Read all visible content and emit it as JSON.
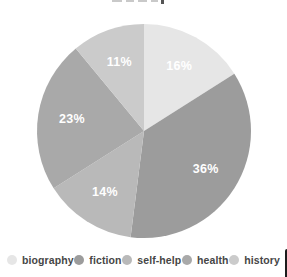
{
  "chart_data": {
    "type": "pie",
    "categories": [
      "biography",
      "fiction",
      "self-help",
      "health",
      "history"
    ],
    "values": [
      16,
      36,
      14,
      23,
      11
    ],
    "labels": [
      "16%",
      "36%",
      "14%",
      "23%",
      "11%"
    ],
    "colors": [
      "#e6e6e6",
      "#9c9c9c",
      "#b9b9b9",
      "#a9a9a9",
      "#cbcbcb"
    ],
    "label_color": "#ffffff",
    "start_angle_deg": 0,
    "direction": "clockwise",
    "legend_position": "bottom"
  },
  "legend": {
    "items": [
      {
        "label": "biography",
        "color": "#e6e6e6"
      },
      {
        "label": "fiction",
        "color": "#9c9c9c"
      },
      {
        "label": "self-help",
        "color": "#b9b9b9"
      },
      {
        "label": "health",
        "color": "#a9a9a9"
      },
      {
        "label": "history",
        "color": "#cbcbcb"
      }
    ]
  }
}
